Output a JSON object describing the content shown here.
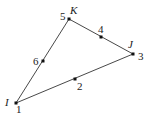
{
  "diagram": {
    "type": "triangular-element",
    "stroke_color": "#333333",
    "vertices": [
      {
        "name": "I",
        "node": "1",
        "x": 16,
        "y": 103
      },
      {
        "name": "J",
        "node": "3",
        "x": 133,
        "y": 54
      },
      {
        "name": "K",
        "node": "5",
        "x": 69,
        "y": 19
      }
    ],
    "midside_nodes": [
      {
        "node": "2",
        "x": 75,
        "y": 79
      },
      {
        "node": "4",
        "x": 101,
        "y": 37
      },
      {
        "node": "6",
        "x": 43,
        "y": 61
      }
    ],
    "labels": {
      "I": "I",
      "J": "J",
      "K": "K",
      "n1": "1",
      "n2": "2",
      "n3": "3",
      "n4": "4",
      "n5": "5",
      "n6": "6"
    }
  }
}
